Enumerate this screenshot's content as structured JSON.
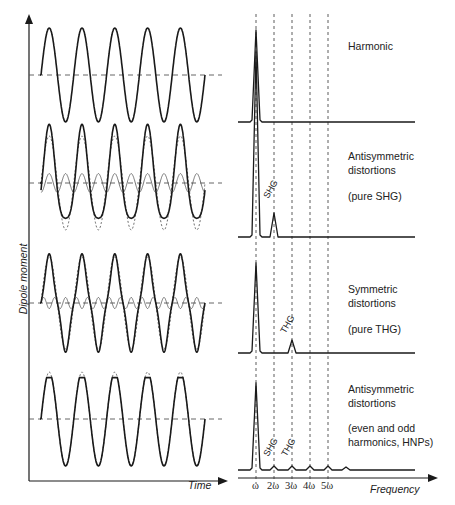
{
  "axes": {
    "left": {
      "ylabel": "Dipole moment",
      "xlabel": "Time"
    },
    "right": {
      "xlabel": "Frequency",
      "ticks": [
        "ω",
        "2ω",
        "3ω",
        "4ω",
        "5ω"
      ]
    }
  },
  "rows": [
    {
      "title": "Harmonic",
      "subtitle": "",
      "peaks": []
    },
    {
      "title": "Antisymmetric",
      "title2": "distortions",
      "subtitle": "(pure SHG)",
      "peaks": [
        "SHG"
      ]
    },
    {
      "title": "Symmetric",
      "title2": "distortions",
      "subtitle": "(pure THG)",
      "peaks": [
        "THG"
      ]
    },
    {
      "title": "Antisymmetric",
      "title2": "distortions",
      "subtitle": "(even and odd",
      "subtitle2": "harmonics, HNPs)",
      "peaks": [
        "SHG",
        "THG"
      ]
    }
  ],
  "chart_data": [
    {
      "type": "line",
      "title": "Time-domain dipole moment",
      "xlabel": "Time",
      "ylabel": "Dipole moment",
      "series": [
        {
          "name": "Harmonic",
          "cycles": 5
        },
        {
          "name": "Antisymmetric distortions (pure SHG)",
          "cycles": 5,
          "components": [
            "fundamental",
            "second harmonic (thin)"
          ]
        },
        {
          "name": "Symmetric distortions (pure THG)",
          "cycles": 5,
          "components": [
            "fundamental",
            "third harmonic (thin)"
          ]
        },
        {
          "name": "Antisymmetric distortions (even and odd harmonics, HNPs)",
          "cycles": 5,
          "note": "clipped peaks"
        }
      ]
    },
    {
      "type": "line",
      "title": "Frequency spectrum",
      "xlabel": "Frequency",
      "categories": [
        "ω",
        "2ω",
        "3ω",
        "4ω",
        "5ω"
      ],
      "series": [
        {
          "name": "Harmonic",
          "values": [
            1.0,
            0,
            0,
            0,
            0
          ]
        },
        {
          "name": "Antisymmetric (pure SHG)",
          "values": [
            1.0,
            0.22,
            0,
            0,
            0
          ]
        },
        {
          "name": "Symmetric (pure THG)",
          "values": [
            1.0,
            0,
            0.12,
            0,
            0
          ]
        },
        {
          "name": "Antisymmetric (even and odd)",
          "values": [
            1.0,
            0.04,
            0.04,
            0.04,
            0.04
          ]
        }
      ]
    }
  ]
}
